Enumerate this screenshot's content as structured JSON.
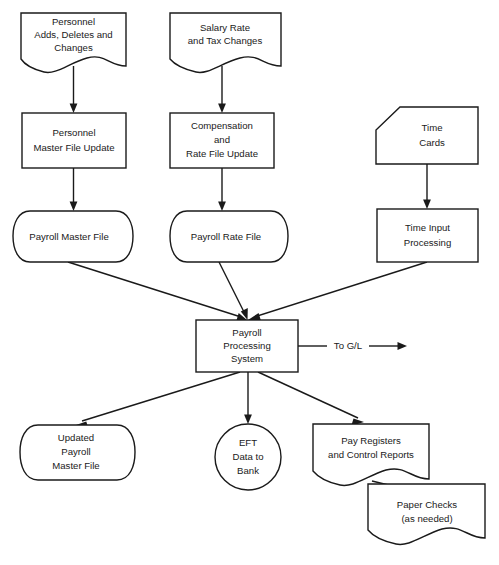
{
  "diagram": {
    "background_color": "#ffffff",
    "line_color": "#1a1a1a",
    "text_color": "#1a1a1a"
  },
  "nodes": {
    "personnel_changes": {
      "shape": "document",
      "lines": [
        "Personnel",
        "Adds, Deletes and",
        "Changes"
      ]
    },
    "salary_changes": {
      "shape": "document",
      "lines": [
        "Salary Rate",
        "and Tax Changes"
      ]
    },
    "time_cards": {
      "shape": "punched-card",
      "lines": [
        "Time",
        "Cards"
      ]
    },
    "personnel_master_update": {
      "shape": "process",
      "lines": [
        "Personnel",
        "Master File Update"
      ]
    },
    "compensation_rate_update": {
      "shape": "process",
      "lines": [
        "Compensation",
        "and",
        "Rate File Update"
      ]
    },
    "time_input_processing": {
      "shape": "process",
      "lines": [
        "Time Input",
        "Processing"
      ]
    },
    "payroll_master_file": {
      "shape": "stored-data",
      "lines": [
        "Payroll Master File"
      ]
    },
    "payroll_rate_file": {
      "shape": "stored-data",
      "lines": [
        "Payroll Rate File"
      ]
    },
    "payroll_processing_system": {
      "shape": "process",
      "lines": [
        "Payroll",
        "Processing",
        "System"
      ]
    },
    "updated_payroll_master_file": {
      "shape": "stored-data",
      "lines": [
        "Updated",
        "Payroll",
        "Master File"
      ]
    },
    "eft_data_to_bank": {
      "shape": "circle",
      "lines": [
        "EFT",
        "Data to",
        "Bank"
      ]
    },
    "pay_registers": {
      "shape": "document",
      "lines": [
        "Pay Registers",
        "and Control Reports"
      ]
    },
    "paper_checks": {
      "shape": "document",
      "lines": [
        "Paper Checks",
        "(as needed)"
      ]
    }
  },
  "edges": {
    "to_gl": {
      "label": "To G/L"
    }
  }
}
